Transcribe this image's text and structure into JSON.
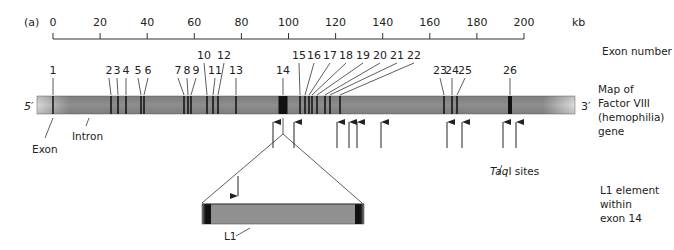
{
  "panel_label": "(a)",
  "axis": {
    "unit": "kb",
    "ticks": [
      "0",
      "20",
      "40",
      "60",
      "80",
      "100",
      "120",
      "140",
      "160",
      "180",
      "200"
    ],
    "tick_values": [
      0,
      20,
      40,
      60,
      80,
      100,
      120,
      140,
      160,
      180,
      200
    ]
  },
  "exon_labels": [
    "1",
    "2",
    "3",
    "4",
    "5",
    "6",
    "7",
    "8",
    "9",
    "10",
    "11",
    "12",
    "13",
    "14",
    "15",
    "16",
    "17",
    "18",
    "19",
    "20",
    "21",
    "22",
    "23",
    "24",
    "25",
    "26"
  ],
  "gene": {
    "five_prime": "5′",
    "three_prime": "3′",
    "exon_label": "Exon",
    "intron_label": "Intron"
  },
  "taq_label_italic": "Taq",
  "taq_label_rest": "I sites",
  "side_labels": {
    "exon_number": "Exon number",
    "map_line1": "Map of",
    "map_line2": "Factor VIII",
    "map_line3": "(hemophilia)",
    "map_line4": "gene",
    "l1_line1": "L1 element",
    "l1_line2": "within",
    "l1_line3": "exon 14"
  },
  "l1_label": "L1",
  "colors": {
    "bar": "#8c8c8c",
    "exon": "#111111",
    "line": "#333333"
  }
}
